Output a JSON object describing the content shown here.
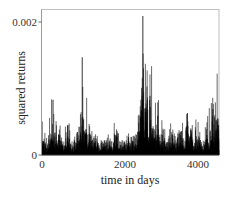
{
  "chart_data": {
    "type": "line",
    "title": "",
    "xlabel": "time in days",
    "ylabel": "squared returns",
    "xlim": [
      0,
      4400
    ],
    "ylim": [
      0,
      0.0022
    ],
    "xticks": [
      0,
      2000,
      4000
    ],
    "xtick_labels": [
      "0",
      "2000",
      "4000"
    ],
    "yticks": [
      0,
      0.002
    ],
    "ytick_labels": [
      "0",
      "0.002"
    ],
    "grid": false,
    "legend": null,
    "series": [
      {
        "name": "squared returns",
        "color": "#000000",
        "n_points": 4400,
        "baseline_level": 8e-05,
        "major_spikes": [
          {
            "x": 30,
            "y": 0.0002
          },
          {
            "x": 274,
            "y": 0.00083
          },
          {
            "x": 400,
            "y": 0.00022
          },
          {
            "x": 640,
            "y": 0.00028
          },
          {
            "x": 1000,
            "y": 0.00147
          },
          {
            "x": 1090,
            "y": 0.00032
          },
          {
            "x": 1300,
            "y": 0.00018
          },
          {
            "x": 1560,
            "y": 0.00022
          },
          {
            "x": 1850,
            "y": 0.00028
          },
          {
            "x": 2140,
            "y": 0.00015
          },
          {
            "x": 2480,
            "y": 0.00101
          },
          {
            "x": 2507,
            "y": 0.00209
          },
          {
            "x": 2560,
            "y": 0.0007
          },
          {
            "x": 2685,
            "y": 0.00089
          },
          {
            "x": 2760,
            "y": 0.0004
          },
          {
            "x": 2877,
            "y": 0.00059
          },
          {
            "x": 3000,
            "y": 0.0003
          },
          {
            "x": 3250,
            "y": 0.00025
          },
          {
            "x": 3450,
            "y": 0.00035
          },
          {
            "x": 3616,
            "y": 0.00063
          },
          {
            "x": 3700,
            "y": 0.0004
          },
          {
            "x": 3900,
            "y": 0.00028
          },
          {
            "x": 4100,
            "y": 0.0003
          },
          {
            "x": 4247,
            "y": 0.00069
          },
          {
            "x": 4329,
            "y": 0.00053
          },
          {
            "x": 4390,
            "y": 0.00045
          }
        ]
      }
    ]
  },
  "axes": {
    "x_label": "time in days",
    "y_label": "squared returns",
    "x_ticks": [
      "0",
      "2000",
      "4000"
    ],
    "y_ticks": [
      "0",
      "0.002"
    ]
  }
}
